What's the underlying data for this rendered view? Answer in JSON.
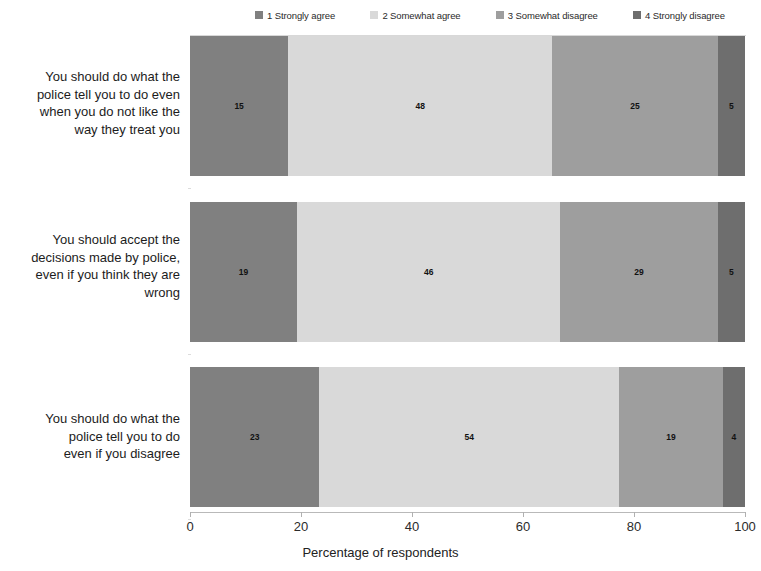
{
  "legend": {
    "items": [
      {
        "label": "1 Strongly agree",
        "color": "#808080"
      },
      {
        "label": "2 Somewhat agree",
        "color": "#d9d9d9"
      },
      {
        "label": "3 Somewhat disagree",
        "color": "#9e9e9e"
      },
      {
        "label": "4 Strongly disagree",
        "color": "#6e6e6e"
      }
    ]
  },
  "axis": {
    "xlabel": "Percentage of respondents",
    "ticks": [
      "0",
      "20",
      "40",
      "60",
      "80",
      "100"
    ],
    "min": 0,
    "max": 100
  },
  "categories": [
    "You should do what the police tell you to do even when you do not like the way they treat you",
    "You should accept the decisions made by police, even if you think they are wrong",
    "You should do what the police tell you to do even if you disagree"
  ],
  "chart_data": {
    "type": "bar",
    "title": "",
    "subtitle": "",
    "orientation": "horizontal",
    "stacked": true,
    "xlabel": "Percentage of respondents",
    "ylabel": "",
    "xlim": [
      0,
      100
    ],
    "xticks": [
      0,
      20,
      40,
      60,
      80,
      100
    ],
    "grid": false,
    "legend_position": "top",
    "categories": [
      "You should do what the police tell you to do even when you do not like the way they treat you",
      "You should accept the decisions made by police, even if you think they are wrong",
      "You should do what the police tell you to do even if you disagree"
    ],
    "series": [
      {
        "name": "1 Strongly agree",
        "color": "#808080",
        "values": [
          15,
          19,
          23
        ]
      },
      {
        "name": "2 Somewhat agree",
        "color": "#d9d9d9",
        "values": [
          48,
          46,
          54
        ]
      },
      {
        "name": "3 Somewhat disagree",
        "color": "#9e9e9e",
        "values": [
          25,
          29,
          19
        ]
      },
      {
        "name": "4 Strongly disagree",
        "color": "#6e6e6e",
        "values": [
          5,
          5,
          4
        ]
      }
    ]
  },
  "rows": [
    {
      "label": "You should do what the police tell you to do even when you do not like the way they treat you",
      "label_lines": [
        "You should do what the",
        "police tell you to do even",
        "when you do not like the",
        "way they treat you"
      ],
      "segments": [
        {
          "value": "15",
          "width": 17.7,
          "color": "#808080"
        },
        {
          "value": "48",
          "width": 47.6,
          "color": "#d9d9d9"
        },
        {
          "value": "25",
          "width": 29.8,
          "color": "#9e9e9e"
        },
        {
          "value": "5",
          "width": 4.9,
          "color": "#6e6e6e"
        }
      ]
    },
    {
      "label": "You should accept the decisions made by police, even if you think they are wrong",
      "label_lines": [
        "You should accept the",
        "decisions made by police,",
        "even if you think they are",
        "wrong"
      ],
      "segments": [
        {
          "value": "19",
          "width": 19.3,
          "color": "#808080"
        },
        {
          "value": "46",
          "width": 47.4,
          "color": "#d9d9d9"
        },
        {
          "value": "29",
          "width": 28.4,
          "color": "#9e9e9e"
        },
        {
          "value": "5",
          "width": 4.9,
          "color": "#6e6e6e"
        }
      ]
    },
    {
      "label": "You should do what the police tell you to do even if you disagree",
      "label_lines": [
        "You should do what the",
        "police tell you to do",
        "even if you disagree"
      ],
      "segments": [
        {
          "value": "23",
          "width": 23.3,
          "color": "#808080"
        },
        {
          "value": "54",
          "width": 54.0,
          "color": "#d9d9d9"
        },
        {
          "value": "19",
          "width": 18.7,
          "color": "#9e9e9e"
        },
        {
          "value": "4",
          "width": 4.0,
          "color": "#6e6e6e"
        }
      ]
    }
  ]
}
